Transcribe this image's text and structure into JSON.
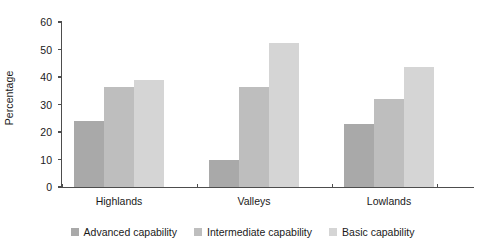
{
  "chart_data": {
    "type": "bar",
    "title": "",
    "xlabel": "",
    "ylabel": "Percentage",
    "ylim": [
      0,
      60
    ],
    "yticks": [
      0,
      10,
      20,
      30,
      40,
      50,
      60
    ],
    "grid": false,
    "legend_position": "bottom",
    "categories": [
      "Highlands",
      "Valleys",
      "Lowlands"
    ],
    "series": [
      {
        "name": "Advanced capability",
        "color": "#a9a9a9",
        "values": [
          24,
          10,
          23
        ]
      },
      {
        "name": "Intermediate capability",
        "color": "#bebebe",
        "values": [
          36.5,
          36.5,
          32
        ]
      },
      {
        "name": "Basic capability",
        "color": "#d5d5d5",
        "values": [
          39,
          52.5,
          43.5
        ]
      }
    ]
  },
  "axis": {
    "y_title": "Percentage",
    "tick_labels": [
      "0",
      "10",
      "20",
      "30",
      "40",
      "50",
      "60"
    ]
  }
}
